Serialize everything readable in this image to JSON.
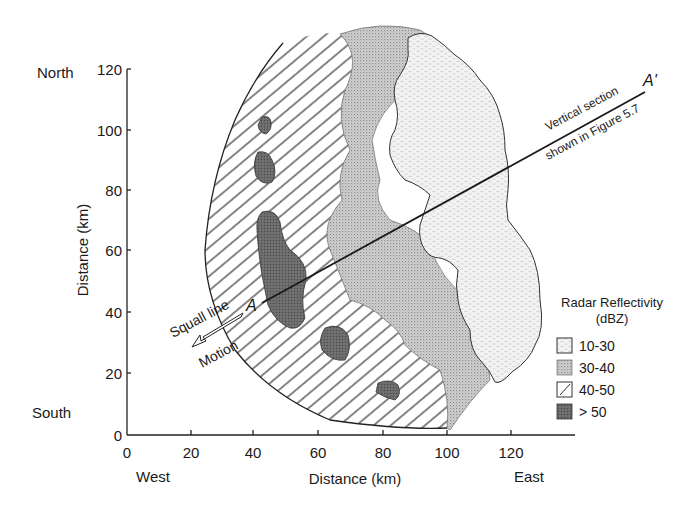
{
  "figure": {
    "type": "radar_reflectivity_map",
    "compass": {
      "north": "North",
      "south": "South",
      "west": "West",
      "east": "East"
    },
    "x_axis": {
      "label": "Distance (km)",
      "ticks": [
        "0",
        "20",
        "40",
        "60",
        "80",
        "100",
        "120"
      ]
    },
    "y_axis": {
      "label": "Distance (km)",
      "ticks": [
        "0",
        "20",
        "40",
        "60",
        "80",
        "100",
        "120"
      ]
    },
    "section": {
      "start_label": "A",
      "end_label": "A'",
      "text_line1": "Vertical section",
      "text_line2": "shown in Figure 5.7"
    },
    "motion": {
      "line1": "Squall line",
      "line2": "Motion"
    },
    "legend": {
      "title_line1": "Radar Reflectivity",
      "title_line2": "(dBZ)",
      "items": [
        {
          "label": "10-30",
          "pattern": "light-stipple"
        },
        {
          "label": "30-40",
          "pattern": "medium-stipple"
        },
        {
          "label": "40-50",
          "pattern": "diagonal-hatch"
        },
        {
          "label": "> 50",
          "pattern": "dark-fill"
        }
      ]
    }
  }
}
